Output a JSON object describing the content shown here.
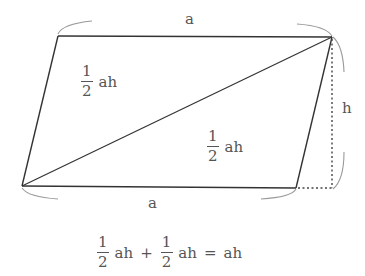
{
  "diagram": {
    "colors": {
      "line": "#333333",
      "brace": "#9a9a9a",
      "text": "#555555"
    },
    "vertices": {
      "top_left": [
        58,
        36
      ],
      "top_right": [
        332,
        37
      ],
      "bottom_left": [
        22,
        186
      ],
      "bottom_right": [
        296,
        188
      ]
    },
    "labels": {
      "top_side": "a",
      "bottom_side": "a",
      "height": "h"
    },
    "upper_triangle_area": {
      "numerator": "1",
      "denominator": "2",
      "text": "ah"
    },
    "lower_triangle_area": {
      "numerator": "1",
      "denominator": "2",
      "text": "ah"
    },
    "equation": {
      "term1": {
        "numerator": "1",
        "denominator": "2",
        "text": "ah"
      },
      "plus": "+",
      "term2": {
        "numerator": "1",
        "denominator": "2",
        "text": "ah"
      },
      "equals": "=",
      "result": "ah"
    }
  }
}
